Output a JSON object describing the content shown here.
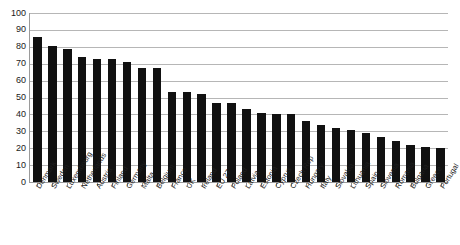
{
  "chart_data": {
    "type": "bar",
    "title": "",
    "subtitle": "",
    "xlabel": "",
    "ylabel": "",
    "ylim": [
      0,
      100
    ],
    "yticks": [
      0,
      10,
      20,
      30,
      40,
      50,
      60,
      70,
      80,
      90,
      100
    ],
    "grid": true,
    "legend": "none",
    "bar_color": "#111111",
    "gridline_color": "#b6b6b6",
    "axis_color": "#9a9a9a",
    "categories": [
      "Denmark",
      "Sweden",
      "Luxembourg",
      "Netherlands",
      "Austria",
      "Finland",
      "Germany",
      "Malta",
      "Belgium",
      "France",
      "UK",
      "Ireland",
      "EU 27",
      "Poland",
      "Latvia",
      "Estonia",
      "Cyprus",
      "Czech Rep",
      "Hungary",
      "Italy",
      "Slovakia",
      "Lithuania",
      "Spain",
      "Slovenia",
      "Romania",
      "Bulgaria",
      "Greece",
      "Portugal"
    ],
    "values": [
      86,
      80.5,
      79,
      74,
      72.5,
      72.5,
      71,
      67.5,
      67.5,
      53,
      53,
      52,
      47,
      46.5,
      43,
      41,
      40,
      40,
      36,
      34,
      32,
      31,
      29,
      26.5,
      24,
      22,
      21,
      20
    ]
  }
}
